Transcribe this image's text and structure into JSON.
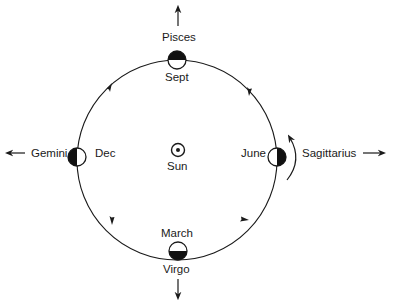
{
  "diagram": {
    "type": "orbit",
    "center": {
      "label": "Sun",
      "icon": "sun-symbol-icon"
    },
    "orbit_direction": "counterclockwise",
    "positions": [
      {
        "id": "top",
        "month": "Sept",
        "constellation": "Pisces",
        "dark_side": "top",
        "arrow": "up"
      },
      {
        "id": "left",
        "month": "Dec",
        "constellation": "Gemini",
        "dark_side": "left",
        "arrow": "left"
      },
      {
        "id": "bottom",
        "month": "March",
        "constellation": "Virgo",
        "dark_side": "bottom",
        "arrow": "down"
      },
      {
        "id": "right",
        "month": "June",
        "constellation": "Sagittarius",
        "dark_side": "right",
        "arrow": "right",
        "rotation_arrow": true
      }
    ],
    "colors": {
      "line": "#1a1a1a",
      "fill_dark": "#111111",
      "fill_light": "#ffffff",
      "background": "#ffffff"
    }
  }
}
